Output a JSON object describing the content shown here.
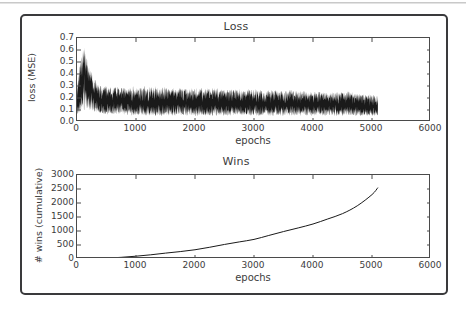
{
  "figure": {
    "background_color": "#ffffff",
    "frame_color": "#3a3a3c",
    "line_color": "#1a1a1a"
  },
  "chart_data": [
    {
      "type": "line",
      "title": "Loss",
      "xlabel": "epochs",
      "ylabel": "loss (MSE)",
      "xlim": [
        0,
        6000
      ],
      "ylim": [
        0.0,
        0.7
      ],
      "xticks": [
        0,
        1000,
        2000,
        3000,
        4000,
        5000,
        6000
      ],
      "xtick_labels": [
        "0",
        "1000",
        "2000",
        "3000",
        "4000",
        "5000",
        "6000"
      ],
      "yticks": [
        0.0,
        0.1,
        0.2,
        0.3,
        0.4,
        0.5,
        0.6,
        0.7
      ],
      "ytick_labels": [
        "0.0",
        "0.1",
        "0.2",
        "0.3",
        "0.4",
        "0.5",
        "0.6",
        "0.7"
      ],
      "grid": false,
      "legend": "none",
      "data_x_end": 5100,
      "description": "Noisy per-epoch training loss. Sharp spike to ~0.65 near epoch 120, rapid decay through epoch ~350, then a dense noise band that slowly narrows from roughly 0.05-0.30 down to roughly 0.05-0.22 by epoch 5100.",
      "envelope": {
        "x": [
          0,
          60,
          120,
          180,
          250,
          320,
          400,
          500,
          700,
          1000,
          1400,
          1800,
          2200,
          2600,
          3000,
          3400,
          3800,
          4200,
          4600,
          4900,
          5100
        ],
        "upper": [
          0.3,
          0.52,
          0.65,
          0.5,
          0.4,
          0.34,
          0.3,
          0.29,
          0.29,
          0.29,
          0.29,
          0.28,
          0.28,
          0.27,
          0.27,
          0.26,
          0.26,
          0.25,
          0.25,
          0.23,
          0.22
        ],
        "lower": [
          0.06,
          0.07,
          0.09,
          0.1,
          0.09,
          0.08,
          0.07,
          0.06,
          0.06,
          0.05,
          0.05,
          0.05,
          0.05,
          0.05,
          0.05,
          0.05,
          0.05,
          0.05,
          0.05,
          0.05,
          0.05
        ],
        "mean": [
          0.14,
          0.28,
          0.42,
          0.31,
          0.24,
          0.2,
          0.18,
          0.17,
          0.17,
          0.16,
          0.16,
          0.16,
          0.16,
          0.15,
          0.15,
          0.15,
          0.15,
          0.15,
          0.14,
          0.13,
          0.13
        ]
      }
    },
    {
      "type": "line",
      "title": "Wins",
      "xlabel": "epochs",
      "ylabel": "# wins (cumulative)",
      "xlim": [
        0,
        6000
      ],
      "ylim": [
        0,
        3000
      ],
      "xticks": [
        0,
        1000,
        2000,
        3000,
        4000,
        5000,
        6000
      ],
      "xtick_labels": [
        "0",
        "1000",
        "2000",
        "3000",
        "4000",
        "5000",
        "6000"
      ],
      "yticks": [
        0,
        500,
        1000,
        1500,
        2000,
        2500,
        3000
      ],
      "ytick_labels": [
        "0",
        "500",
        "1000",
        "1500",
        "2000",
        "2500",
        "3000"
      ],
      "grid": false,
      "legend": "none",
      "data_x_end": 5100,
      "description": "Smooth, convex cumulative win count rising with increasing slope from 0 to about 2550 wins at epoch 5100.",
      "x": [
        0,
        250,
        500,
        750,
        1000,
        1250,
        1500,
        1750,
        2000,
        2250,
        2500,
        2750,
        3000,
        3250,
        3500,
        3750,
        4000,
        4250,
        4500,
        4750,
        5000,
        5100
      ],
      "y": [
        0,
        10,
        30,
        60,
        100,
        150,
        210,
        265,
        330,
        420,
        520,
        610,
        700,
        840,
        980,
        1110,
        1250,
        1430,
        1620,
        1900,
        2300,
        2550
      ]
    }
  ]
}
